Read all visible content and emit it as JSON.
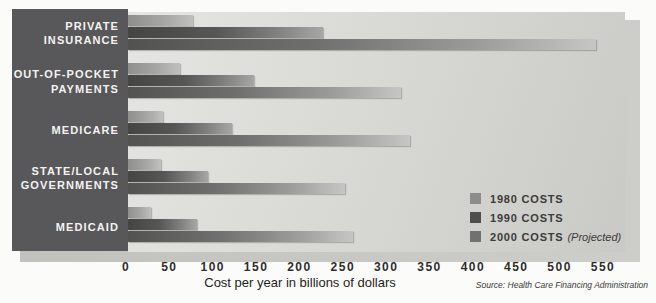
{
  "chart_data": {
    "type": "bar",
    "orientation": "horizontal",
    "title": "",
    "categories": [
      "Private Insurance",
      "Out-of-Pocket Payments",
      "Medicare",
      "State/Local Governments",
      "Medicaid"
    ],
    "series": [
      {
        "name": "1980 Costs",
        "color": "#8c8c8a",
        "values": [
          75,
          60,
          40,
          38,
          27
        ]
      },
      {
        "name": "1990 Costs",
        "color": "#4e4e4c",
        "values": [
          225,
          145,
          120,
          92,
          80
        ]
      },
      {
        "name": "2000 Costs (Projected)",
        "color": "#717170",
        "values": [
          540,
          315,
          325,
          250,
          260
        ]
      }
    ],
    "xlabel": "Cost per year in billions of dollars",
    "ylabel": "",
    "xlim": [
      0,
      550
    ],
    "x_ticks": [
      "0",
      "50",
      "100",
      "150",
      "200",
      "250",
      "300",
      "350",
      "400",
      "450",
      "500",
      "550"
    ],
    "grid": false,
    "legend_position": "inside-right-bottom"
  },
  "sidebar": {
    "items": [
      {
        "lines": [
          "PRIVATE",
          "INSURANCE"
        ]
      },
      {
        "lines": [
          "OUT-OF-POCKET",
          "PAYMENTS"
        ]
      },
      {
        "lines": [
          "MEDICARE"
        ]
      },
      {
        "lines": [
          "STATE/LOCAL",
          "GOVERNMENTS"
        ]
      },
      {
        "lines": [
          "MEDICAID"
        ]
      }
    ]
  },
  "legend": {
    "items": [
      {
        "label": "1980 COSTS",
        "suffix": ""
      },
      {
        "label": "1990 COSTS",
        "suffix": ""
      },
      {
        "label": "2000 COSTS",
        "suffix": "(Projected)"
      }
    ]
  },
  "footer": {
    "xlabel": "Cost per year in billions of dollars",
    "source": "Source: Health Care Financing Administration"
  },
  "colors": {
    "sidebar_bg": "#58585a",
    "plot_bg": "#d6d6d2",
    "page_bg": "#fbfbf9",
    "shadow": "#c6c6c2"
  }
}
